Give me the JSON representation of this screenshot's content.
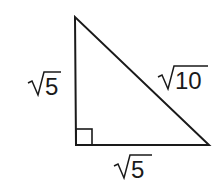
{
  "diagram": {
    "type": "right-triangle",
    "vertices": {
      "top": [
        75,
        17
      ],
      "right_angle": [
        76,
        145
      ],
      "bottom_right": [
        209,
        145
      ]
    },
    "right_angle_marker": true,
    "labels": {
      "left_leg": {
        "radicand": "5",
        "text": "√5"
      },
      "hypotenuse": {
        "radicand": "10",
        "text": "√10"
      },
      "bottom_leg": {
        "radicand": "5",
        "text": "√5"
      }
    },
    "colors": {
      "stroke": "#1a1a1a",
      "background": "#ffffff"
    }
  }
}
